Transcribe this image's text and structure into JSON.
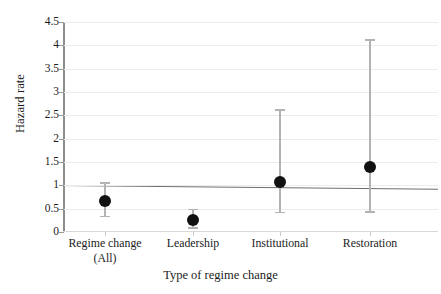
{
  "chart_data": {
    "type": "scatter",
    "title": "",
    "xlabel": "Type of regime change",
    "ylabel": "Hazard rate",
    "categories": [
      "Regime change (All)",
      "Leadership",
      "Institutional",
      "Restoration"
    ],
    "category_lines": [
      [
        "Regime change",
        "(All)"
      ],
      [
        "Leadership",
        ""
      ],
      [
        "Institutional",
        ""
      ],
      [
        "Restoration",
        ""
      ]
    ],
    "values": [
      0.67,
      0.25,
      1.08,
      1.4
    ],
    "ci_low": [
      0.35,
      0.1,
      0.43,
      0.45
    ],
    "ci_high": [
      1.07,
      0.5,
      2.63,
      4.13
    ],
    "ylim": [
      0,
      4.5
    ],
    "yticks": [
      0,
      0.5,
      1,
      1.5,
      2,
      2.5,
      3,
      3.5,
      4,
      4.5
    ],
    "ytick_labels": [
      "0",
      "0.5",
      "1",
      "1.5",
      "2",
      "2.5",
      "3",
      "3.5",
      "4",
      "4.5"
    ],
    "reference_line": 1,
    "grid": true,
    "legend": "none",
    "marker": "filled-circle",
    "errorbar_style": "capped-whisker",
    "colors": {
      "marker": "#111111",
      "whisker": "#b3b3b3",
      "axis": "#8e8e8e",
      "grid": "#ececec",
      "reference": "#6f6f6f",
      "text": "#1c1c1c",
      "background": "#ffffff"
    }
  }
}
